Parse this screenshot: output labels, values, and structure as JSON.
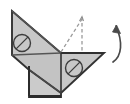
{
  "figure": {
    "canvas": {
      "width": 130,
      "height": 104,
      "background": "#ffffff"
    },
    "colors": {
      "paper_fill": "#c8c8c8",
      "paper_fill_light": "#d2d2d2",
      "paper_fill_dark": "#bdbdbd",
      "outline": "#3a3a3a",
      "outline_heavy": "#2b2b2b",
      "crease": "#6e6e6e",
      "dashed": "#9a9a9a",
      "arrow": "#4a4a4a",
      "marker": "#3c3c3c"
    },
    "shapes": [
      {
        "name": "upper-left-triangle-panel",
        "type": "polygon",
        "points": "12,12 12,55 60,52",
        "fill": "#c8c8c8"
      },
      {
        "name": "upper-right-triangle-panel",
        "type": "polygon",
        "points": "12,12 60,52 60,52",
        "fill": "#cdcdcd"
      },
      {
        "name": "lower-left-wing-panel",
        "type": "polygon",
        "points": "12,55 60,52 60,92 28,70",
        "fill": "#c3c3c3"
      },
      {
        "name": "lower-right-wing-panel",
        "type": "polygon",
        "points": "60,52 104,52 60,92",
        "fill": "#c8c8c8"
      },
      {
        "name": "bottom-flap-rectangle",
        "type": "polygon",
        "points": "28,68 60,68 60,96 28,96",
        "fill": "#cbcbcb"
      }
    ],
    "creases": [
      {
        "name": "crease-diagonal-upper",
        "from": "12,12",
        "to": "60,52"
      },
      {
        "name": "crease-horizontal-mid",
        "from": "12,55",
        "to": "60,52"
      },
      {
        "name": "crease-diagonal-lower",
        "from": "28,70",
        "to": "60,92"
      },
      {
        "name": "crease-vertical-center",
        "from": "60,52",
        "to": "60,96"
      }
    ],
    "dashed_guides": [
      {
        "name": "dashed-hypotenuse-guide",
        "from": "60,52",
        "to": "82,18",
        "label": "previous flap edge"
      },
      {
        "name": "dashed-vertical-guide",
        "from": "82,18",
        "to": "82,52",
        "label": "flap height"
      }
    ],
    "markers": [
      {
        "name": "fold-marker-upper-left",
        "type": "circle-with-slash",
        "cx": 22,
        "cy": 43,
        "r": 8.5,
        "label": "fold marker 1"
      },
      {
        "name": "fold-marker-lower-right",
        "type": "circle-with-slash",
        "cx": 74,
        "cy": 68,
        "r": 8.5,
        "label": "fold marker 2"
      }
    ],
    "arrow": {
      "name": "fold-up-arrow",
      "type": "curved",
      "path": "M 113 62 C 122 56 123 42 116 26",
      "direction": "upward",
      "label": "fold up"
    },
    "caption": ""
  }
}
